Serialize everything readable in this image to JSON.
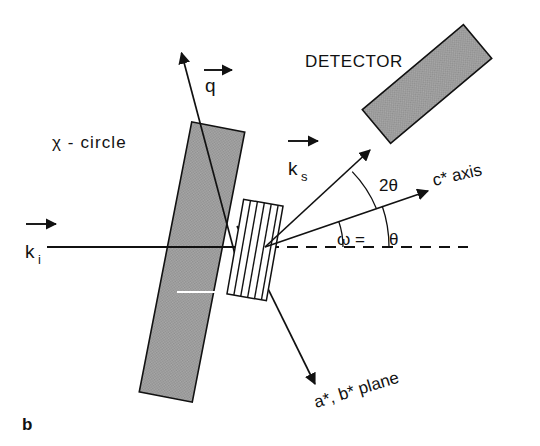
{
  "figure": {
    "panel_label": "b",
    "background_color": "#ffffff",
    "ink_color": "#111111",
    "bar_fill_color": "#a0a0a0"
  },
  "labels": {
    "detector": "DETECTOR",
    "chi_circle": "χ - circle",
    "c_star_axis": "c* axis",
    "ab_plane": "a*, b* plane",
    "two_theta": "2θ",
    "omega_equals": "ω =",
    "theta": "θ",
    "k_i_symbol": "k",
    "k_i_sub": "i",
    "k_s_symbol": "k",
    "k_s_sub": "s",
    "q_symbol": "q"
  },
  "geometry": {
    "scattering_origin": {
      "x": 265,
      "y": 247
    },
    "incident_beam": {
      "x1": 47,
      "y1": 247,
      "x2": 265,
      "y2": 247
    },
    "dashed_axis": {
      "x1": 268,
      "y1": 247,
      "x2": 468,
      "y2": 247
    },
    "c_star_axis": {
      "x1": 265,
      "y1": 247,
      "x2": 432,
      "y2": 190
    },
    "k_s_vector": {
      "x1": 265,
      "y1": 247,
      "x2": 372,
      "y2": 148
    },
    "q_vector": {
      "x1": 238,
      "y1": 268,
      "x2": 181,
      "y2": 52
    },
    "ab_plane_vector": {
      "x1": 238,
      "y1": 228,
      "x2": 316,
      "y2": 386
    },
    "chi_bar": {
      "cx": 192,
      "cy": 262,
      "width": 54,
      "height": 275,
      "rotation_deg": 11
    },
    "detector_bar": {
      "cx": 427,
      "cy": 84,
      "width": 132,
      "height": 44,
      "rotation_deg": -40
    },
    "sample": {
      "cx": 255,
      "cy": 250,
      "width": 40,
      "height": 96,
      "rotation_deg": 10,
      "lattice_planes": 5
    },
    "arc_omega": {
      "radius": 78,
      "from_deg": 0,
      "to_deg": 18
    },
    "arc_two_theta_outer": {
      "radius": 124,
      "from_deg": 0,
      "to_deg": 18
    },
    "arc_two_theta": {
      "radius": 118,
      "from_deg": 18,
      "to_deg": 42
    }
  },
  "angles": {
    "omega_deg": 18,
    "theta_deg": 18,
    "two_theta_deg": 42
  }
}
